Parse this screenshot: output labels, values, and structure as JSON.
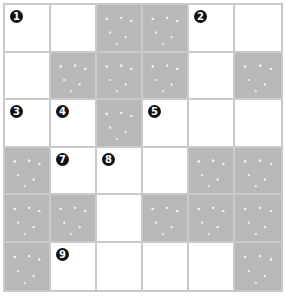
{
  "puzzle": {
    "rows": 6,
    "cols": 6,
    "colors": {
      "shaded": "#b8b8b8",
      "open": "#ffffff",
      "gridline": "#cacaca",
      "number_badge": "#111111"
    },
    "cells": [
      [
        {
          "shaded": false,
          "number": "1"
        },
        {
          "shaded": false,
          "number": ""
        },
        {
          "shaded": true,
          "number": ""
        },
        {
          "shaded": true,
          "number": ""
        },
        {
          "shaded": false,
          "number": "2"
        },
        {
          "shaded": false,
          "number": ""
        }
      ],
      [
        {
          "shaded": false,
          "number": ""
        },
        {
          "shaded": true,
          "number": ""
        },
        {
          "shaded": true,
          "number": ""
        },
        {
          "shaded": true,
          "number": ""
        },
        {
          "shaded": false,
          "number": ""
        },
        {
          "shaded": true,
          "number": ""
        }
      ],
      [
        {
          "shaded": false,
          "number": "3"
        },
        {
          "shaded": false,
          "number": "4"
        },
        {
          "shaded": true,
          "number": ""
        },
        {
          "shaded": false,
          "number": "5"
        },
        {
          "shaded": false,
          "number": ""
        },
        {
          "shaded": false,
          "number": ""
        }
      ],
      [
        {
          "shaded": true,
          "number": ""
        },
        {
          "shaded": false,
          "number": "7"
        },
        {
          "shaded": false,
          "number": "8"
        },
        {
          "shaded": false,
          "number": ""
        },
        {
          "shaded": true,
          "number": ""
        },
        {
          "shaded": true,
          "number": ""
        }
      ],
      [
        {
          "shaded": true,
          "number": ""
        },
        {
          "shaded": true,
          "number": ""
        },
        {
          "shaded": false,
          "number": ""
        },
        {
          "shaded": true,
          "number": ""
        },
        {
          "shaded": true,
          "number": ""
        },
        {
          "shaded": true,
          "number": ""
        }
      ],
      [
        {
          "shaded": true,
          "number": ""
        },
        {
          "shaded": false,
          "number": "9"
        },
        {
          "shaded": false,
          "number": ""
        },
        {
          "shaded": false,
          "number": ""
        },
        {
          "shaded": false,
          "number": ""
        },
        {
          "shaded": true,
          "number": ""
        }
      ]
    ]
  }
}
